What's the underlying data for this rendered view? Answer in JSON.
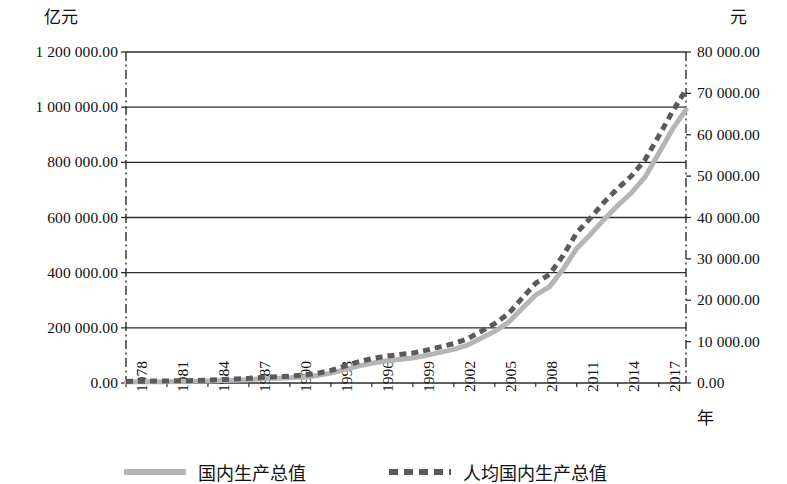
{
  "axes": {
    "left_unit": "亿元",
    "right_unit": "元",
    "x_title": "年",
    "left_ticks": [
      "1 200 000.00",
      "1 000 000.00",
      "800 000.00",
      "600 000.00",
      "400 000.00",
      "200 000.00",
      "0.00"
    ],
    "right_ticks": [
      "80 000.00",
      "70 000.00",
      "60 000.00",
      "50 000.00",
      "40 000.00",
      "30 000.00",
      "20 000.00",
      "10 000.00",
      "0.00"
    ],
    "x_ticks": [
      "1978",
      "1981",
      "1984",
      "1987",
      "1990",
      "1993",
      "1996",
      "1999",
      "2002",
      "2005",
      "2008",
      "2011",
      "2014",
      "2017"
    ]
  },
  "legend": {
    "items": [
      {
        "label": "国内生产总值",
        "style": "solid",
        "color": "#b5b5b5"
      },
      {
        "label": "人均国内生产总值",
        "style": "dashed",
        "color": "#5a5a5a"
      }
    ]
  },
  "colors": {
    "gdp_line": "#b5b5b5",
    "gdp_per_capita_line": "#5a5a5a",
    "gridline": "#2c2c2c",
    "frame": "#2c2c2c",
    "background": "#ffffff"
  },
  "chart_data": {
    "type": "line",
    "title": "",
    "subtitle": "",
    "xlabel": "年",
    "ylabel": "亿元",
    "y2label": "元",
    "grid": true,
    "legend_position": "bottom",
    "xlim": [
      1978,
      2019
    ],
    "ylim": [
      0,
      1200000
    ],
    "y2lim": [
      0,
      80000
    ],
    "ytick_step": 200000,
    "y2tick_step": 10000,
    "xtick_step": 3,
    "x": [
      1978,
      1979,
      1980,
      1981,
      1982,
      1983,
      1984,
      1985,
      1986,
      1987,
      1988,
      1989,
      1990,
      1991,
      1992,
      1993,
      1994,
      1995,
      1996,
      1997,
      1998,
      1999,
      2000,
      2001,
      2002,
      2003,
      2004,
      2005,
      2006,
      2007,
      2008,
      2009,
      2010,
      2011,
      2012,
      2013,
      2014,
      2015,
      2016,
      2017,
      2018,
      2019
    ],
    "series": [
      {
        "name": "国内生产总值",
        "axis": "left",
        "unit": "亿元",
        "style": "solid",
        "color": "#b5b5b5",
        "values": [
          3678.7,
          4100.5,
          4587.6,
          4935.8,
          5373.4,
          6020.9,
          7278.5,
          9098.9,
          10376.2,
          12174.6,
          15180.4,
          17179.7,
          18872.9,
          22005.6,
          27194.5,
          35673.2,
          48637.5,
          61339.9,
          71813.6,
          79715.0,
          85195.5,
          90564.4,
          100280.1,
          110863.1,
          121717.4,
          137422.0,
          161840.2,
          187318.9,
          219438.5,
          270092.3,
          319244.6,
          348517.7,
          412119.3,
          487940.2,
          538580.0,
          592963.2,
          643563.1,
          688858.2,
          746395.1,
          832035.9,
          919281.1,
          990865.1
        ]
      },
      {
        "name": "人均国内生产总值",
        "axis": "right",
        "unit": "元",
        "style": "dashed",
        "color": "#5a5a5a",
        "values": [
          385,
          423,
          468,
          497,
          533,
          588,
          702,
          866,
          973,
          1123,
          1378,
          1536,
          1663,
          1912,
          2334,
          3027,
          4081,
          5091,
          5898,
          6481,
          6860,
          7229,
          7942,
          8717,
          9506,
          10666,
          12487,
          14368,
          16738,
          20505,
          24121,
          26222,
          30808,
          36302,
          39874,
          43684,
          47005,
          50028,
          53935,
          59660,
          65534,
          70892
        ]
      }
    ]
  }
}
